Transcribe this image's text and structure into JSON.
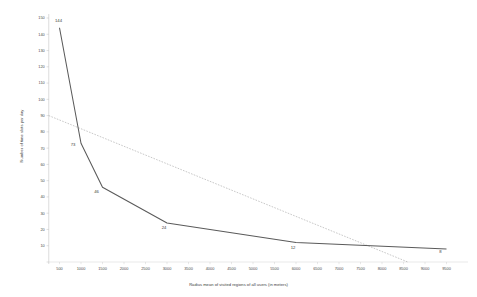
{
  "chart_data": {
    "type": "line",
    "title": "",
    "xlabel": "Radius mean of visited regions of all users (in meters)",
    "ylabel": "Number of time slots per day",
    "xlim": [
      0,
      10000
    ],
    "ylim": [
      0,
      150
    ],
    "grid": false,
    "legend": "none",
    "x_ticks": [
      500,
      1000,
      1500,
      2000,
      2500,
      3000,
      3500,
      4000,
      4500,
      5000,
      5500,
      6000,
      6500,
      7000,
      7500,
      8000,
      8500,
      9000,
      9500
    ],
    "y_ticks": [
      150,
      140,
      130,
      120,
      110,
      100,
      90,
      80,
      70,
      60,
      50,
      40,
      30,
      20,
      10,
      0
    ],
    "series": [
      {
        "name": "Number of time slots per day",
        "style": "solid",
        "color": "#5a5a5a",
        "x": [
          500,
          1000,
          1500,
          3000,
          6000,
          9500
        ],
        "values": [
          144,
          73,
          46,
          24,
          12,
          8
        ],
        "point_labels": [
          "144",
          "73",
          "46",
          "24",
          "12",
          "8"
        ]
      },
      {
        "name": "Linear trend",
        "style": "dashed",
        "color": "#9a9a9a",
        "x": [
          250,
          8600
        ],
        "values": [
          90,
          0
        ],
        "point_labels": []
      }
    ]
  }
}
